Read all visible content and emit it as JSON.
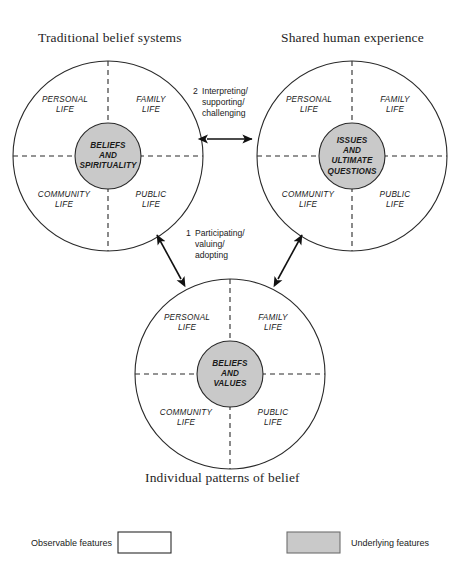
{
  "diagram": {
    "title_top_left": "Traditional belief systems",
    "title_top_right": "Shared human experience",
    "caption_bottom": "Individual patterns of belief",
    "colors": {
      "underlying_fill": "#c9c9c9",
      "observable_fill": "#ffffff",
      "stroke": "#2a2a2a"
    },
    "circles": [
      {
        "id": "traditional-belief-systems",
        "core_label": "BELIEFS\nAND\nSPIRITUALITY",
        "quadrants": {
          "top_left": "PERSONAL\nLIFE",
          "top_right": "FAMILY\nLIFE",
          "bottom_left": "COMMUNITY\nLIFE",
          "bottom_right": "PUBLIC\nLIFE"
        }
      },
      {
        "id": "shared-human-experience",
        "core_label": "ISSUES\nAND\nULTIMATE\nQUESTIONS",
        "quadrants": {
          "top_left": "PERSONAL\nLIFE",
          "top_right": "FAMILY\nLIFE",
          "bottom_left": "COMMUNITY\nLIFE",
          "bottom_right": "PUBLIC\nLIFE"
        }
      },
      {
        "id": "individual-patterns-of-belief",
        "core_label": "BELIEFS\nAND\nVALUES",
        "quadrants": {
          "top_left": "PERSONAL\nLIFE",
          "top_right": "FAMILY\nLIFE",
          "bottom_left": "COMMUNITY\nLIFE",
          "bottom_right": "PUBLIC\nLIFE"
        }
      }
    ],
    "connectors": [
      {
        "id": "connector-2",
        "number": "2",
        "label": "Interpreting/\nsupporting/\nchallenging",
        "style": "double-headed-horizontal"
      },
      {
        "id": "connector-1",
        "number": "1",
        "label": "Participating/\nvaluing/\nadopting",
        "style": "double-headed-diagonal-pair"
      }
    ],
    "legend": {
      "observable_label": "Observable features",
      "underlying_label": "Underlying features"
    }
  }
}
